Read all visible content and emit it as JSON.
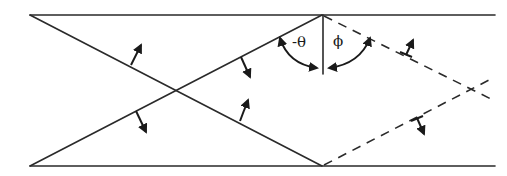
{
  "diagram": {
    "type": "waveguide ray reflection",
    "labels": {
      "incident_angle": "-θ",
      "reflected_angle": "ϕ"
    },
    "walls": {
      "top": {
        "x1": 30,
        "y1": 15,
        "x2": 495,
        "y2": 15
      },
      "bottom": {
        "x1": 30,
        "y1": 166,
        "x2": 495,
        "y2": 166
      }
    },
    "rays_solid": [
      {
        "x1": 30,
        "y1": 15,
        "x2": 322,
        "y2": 166
      },
      {
        "x1": 30,
        "y1": 166,
        "x2": 322,
        "y2": 15
      }
    ],
    "rays_dashed": [
      {
        "x1": 322,
        "y1": 15,
        "x2": 495,
        "y2": 101
      },
      {
        "x1": 322,
        "y1": 166,
        "x2": 493,
        "y2": 78
      }
    ],
    "normal": {
      "x1": 323,
      "y1": 15,
      "x2": 323,
      "y2": 74
    },
    "wavefront_arrows": [
      {
        "x1": 131,
        "y1": 65,
        "x2": 141,
        "y2": 45
      },
      {
        "x1": 241,
        "y1": 57,
        "x2": 250,
        "y2": 77
      },
      {
        "x1": 240,
        "y1": 121,
        "x2": 248,
        "y2": 100
      },
      {
        "x1": 136,
        "y1": 111,
        "x2": 146,
        "y2": 132
      },
      {
        "x1": 406,
        "y1": 55,
        "x2": 413,
        "y2": 40
      },
      {
        "x1": 417,
        "y1": 118,
        "x2": 424,
        "y2": 134
      }
    ],
    "colors": {
      "line": "#2a2a2a",
      "background": "#ffffff"
    }
  }
}
